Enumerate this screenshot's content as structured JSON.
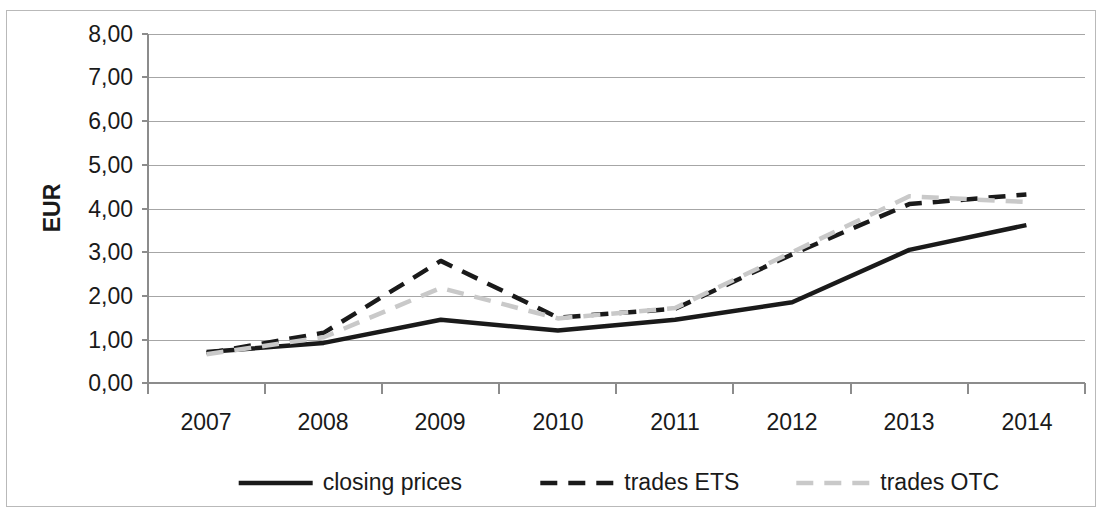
{
  "chart_data": {
    "type": "line",
    "title": "",
    "xlabel": "",
    "ylabel": "EUR",
    "ylim": [
      0,
      8
    ],
    "ytick_step": 1,
    "grid": true,
    "legend_position": "bottom",
    "decimal_separator": ",",
    "categories": [
      "2007",
      "2008",
      "2009",
      "2010",
      "2011",
      "2012",
      "2013",
      "2014"
    ],
    "ytick_labels": [
      "0,00",
      "1,00",
      "2,00",
      "3,00",
      "4,00",
      "5,00",
      "6,00",
      "7,00",
      "8,00"
    ],
    "ytick_values": [
      0,
      1,
      2,
      3,
      4,
      5,
      6,
      7,
      8
    ],
    "series": [
      {
        "name": "closing prices",
        "style": "solid",
        "color": "#1a1a1a",
        "width": 4.5,
        "values": [
          0.71,
          0.92,
          1.45,
          1.2,
          1.45,
          1.85,
          3.05,
          3.62
        ]
      },
      {
        "name": "trades ETS",
        "style": "dashed",
        "color": "#1a1a1a",
        "width": 4.5,
        "values": [
          0.68,
          1.15,
          2.8,
          1.5,
          1.7,
          2.95,
          4.1,
          4.32
        ]
      },
      {
        "name": "trades OTC",
        "style": "dashed",
        "color": "#c9c9c9",
        "width": 4.5,
        "values": [
          0.66,
          1.05,
          2.18,
          1.48,
          1.72,
          3.0,
          4.28,
          4.15
        ]
      }
    ]
  },
  "axis": {
    "y_title": "EUR"
  },
  "legend": {
    "items": [
      {
        "label": "closing prices"
      },
      {
        "label": "trades ETS"
      },
      {
        "label": "trades OTC"
      }
    ]
  }
}
